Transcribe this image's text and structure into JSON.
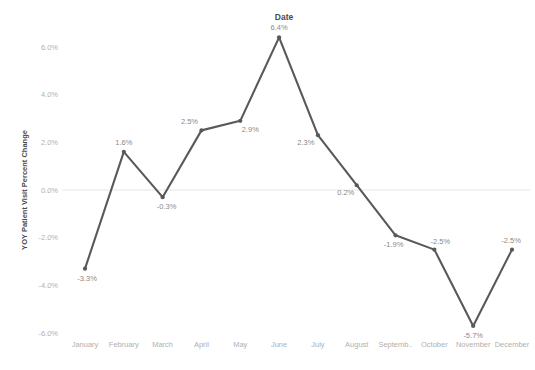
{
  "chart_data": {
    "type": "line",
    "title": "Date",
    "xlabel": "",
    "ylabel": "YOY Patient Visit Percent Change",
    "categories": [
      "January",
      "February",
      "March",
      "April",
      "May",
      "June",
      "July",
      "August",
      "Septemb..",
      "October",
      "November",
      "December"
    ],
    "values": [
      -3.3,
      1.6,
      -0.3,
      2.5,
      2.9,
      6.4,
      2.3,
      0.2,
      -1.9,
      -2.5,
      -5.7,
      -2.5
    ],
    "point_labels": [
      "-3.3%",
      "1.6%",
      "-0.3%",
      "2.5%",
      "2.9%",
      "6.4%",
      "2.3%",
      "0.2%",
      "-1.9%",
      "-2.5%",
      "-5.7%",
      "-2.5%"
    ],
    "label_positions": [
      "below",
      "above",
      "below",
      "above",
      "below",
      "above",
      "below",
      "below",
      "below",
      "above",
      "below",
      "above"
    ],
    "y_ticks": [
      6.0,
      4.0,
      2.0,
      0.0,
      -2.0,
      -4.0,
      -6.0
    ],
    "y_tick_labels": [
      "6.0%",
      "4.0%",
      "2.0%",
      "0.0%",
      "-2.0%",
      "-4.0%",
      "-6.0%"
    ],
    "ylim": [
      -7.0,
      7.0
    ],
    "grid": false,
    "zero_line": true,
    "legend": "none",
    "series_color": "#595959",
    "tick_color": "#b0b0b0",
    "label_color": "#8a8a8a",
    "title_color": "#4a4a4a",
    "zero_line_color": "#ebe5e5"
  }
}
